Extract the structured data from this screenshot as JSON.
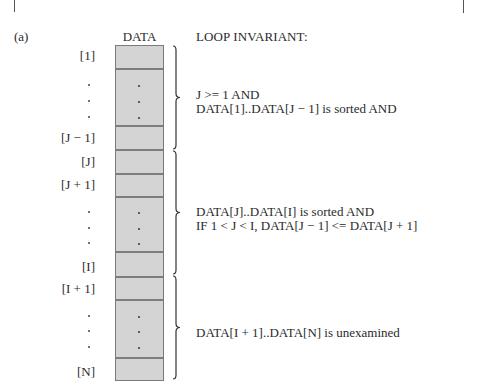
{
  "figure_label": "(a)",
  "array": {
    "header": "DATA",
    "index_labels": [
      {
        "text": "[1]",
        "top": 49
      },
      {
        "text": "[J − 1]",
        "top": 131
      },
      {
        "text": "[J]",
        "top": 155
      },
      {
        "text": "[J + 1]",
        "top": 178
      },
      {
        "text": "[I]",
        "top": 260
      },
      {
        "text": "[I + 1]",
        "top": 282
      },
      {
        "text": "[N]",
        "top": 365
      }
    ],
    "ellipsis_rows": [
      {
        "dots_y": [
          84,
          100,
          116
        ]
      },
      {
        "dots_y": [
          211,
          227,
          242
        ]
      },
      {
        "dots_y": [
          315,
          330,
          346
        ]
      }
    ],
    "divider_y": [
      22,
      79,
      103,
      127,
      150,
      205,
      230,
      253,
      311
    ]
  },
  "invariant": {
    "header": "LOOP INVARIANT:",
    "sections": [
      {
        "lines": [
          "J >= 1 AND",
          "DATA[1]..DATA[J − 1] is sorted AND"
        ],
        "text_top": 88,
        "brace": {
          "top": 45,
          "bottom": 150
        }
      },
      {
        "lines": [
          "DATA[J]..DATA[I] is sorted AND",
          "IF 1 < J < I, DATA[J − 1] <= DATA[J + 1]"
        ],
        "text_top": 205,
        "brace": {
          "top": 150,
          "bottom": 275
        }
      },
      {
        "lines": [
          "DATA[I + 1]..DATA[N] is unexamined"
        ],
        "text_top": 326,
        "brace": {
          "top": 275,
          "bottom": 380
        }
      }
    ]
  },
  "colors": {
    "cell_fill": "#d4d4d4",
    "cell_border": "#7a7a7a",
    "text": "#2a2a2a"
  }
}
